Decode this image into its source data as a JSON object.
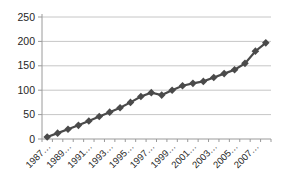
{
  "chart_data": {
    "type": "line",
    "title": "",
    "x": [
      1987,
      1988,
      1989,
      1990,
      1991,
      1992,
      1993,
      1994,
      1995,
      1996,
      1997,
      1998,
      1999,
      2000,
      2001,
      2002,
      2003,
      2004,
      2005,
      2006,
      2007,
      2008
    ],
    "values": [
      4,
      12,
      20,
      28,
      37,
      46,
      55,
      64,
      75,
      87,
      95,
      90,
      100,
      109,
      114,
      118,
      126,
      134,
      142,
      155,
      180,
      197
    ],
    "x_tick_labels": [
      "1987…",
      "1989…",
      "1991…",
      "1993…",
      "1995…",
      "1997…",
      "1999…",
      "2001…",
      "2003…",
      "2005…",
      "2007…"
    ],
    "x_label_every": 2,
    "y_ticks": [
      0,
      50,
      100,
      150,
      200,
      250
    ],
    "ylim": [
      0,
      250
    ],
    "grid": true,
    "legend": "none",
    "marker": "diamond",
    "colors": {
      "series": "#4a4a4a",
      "gridline": "#c6c6c6",
      "axis": "#9a9a9a",
      "tick_label": "#262626",
      "background": "#ffffff"
    }
  }
}
